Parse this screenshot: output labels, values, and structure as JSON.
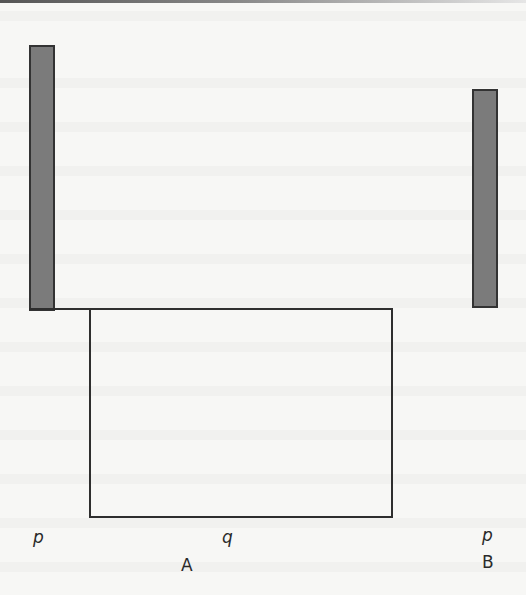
{
  "diagram": {
    "labels": {
      "left_bar_label": "p",
      "rect_label": "q",
      "group_a": "A",
      "right_bar_label": "p",
      "group_b": "B"
    },
    "colors": {
      "bar_fill": "#7b7b7b",
      "outline": "#2e2e2e",
      "background": "#f7f7f5"
    },
    "shapes": {
      "left_bar": {
        "x": 29,
        "y": 45,
        "width": 26,
        "height": 266
      },
      "connector_line": {
        "x": 29,
        "y": 308,
        "width": 62,
        "height": 2
      },
      "rectangle": {
        "x": 89,
        "y": 308,
        "width": 304,
        "height": 210
      },
      "right_bar": {
        "x": 472,
        "y": 89,
        "width": 26,
        "height": 219
      }
    }
  }
}
